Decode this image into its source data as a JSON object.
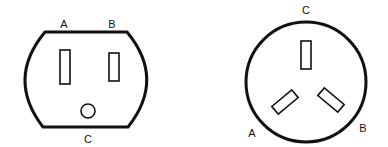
{
  "diagram": {
    "colors": {
      "stroke": "#111111",
      "background": "#ffffff"
    },
    "outlets": [
      {
        "name": "us-style-outlet",
        "labels": {
          "a": "A",
          "b": "B",
          "c": "C"
        },
        "slots": [
          "A",
          "B"
        ],
        "ground_hole": "C"
      },
      {
        "name": "round-three-pin-outlet",
        "labels": {
          "a": "A",
          "b": "B",
          "c": "C"
        },
        "slots": [
          "A",
          "B",
          "C"
        ]
      }
    ]
  }
}
